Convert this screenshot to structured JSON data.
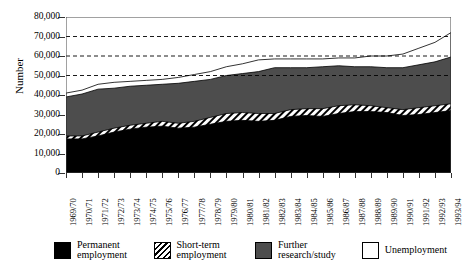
{
  "chart_data": {
    "type": "area",
    "stacked": true,
    "title": "",
    "xlabel": "",
    "ylabel": "Number",
    "ylim": [
      0,
      80000
    ],
    "ytick_step": 10000,
    "ytick_labels": [
      "80,000",
      "70,000",
      "60,000",
      "50,000",
      "40,000",
      "30,000",
      "20,000",
      "10,000",
      "0"
    ],
    "ytick_values": [
      80000,
      70000,
      60000,
      50000,
      40000,
      30000,
      20000,
      10000,
      0
    ],
    "grid": "horizontal-dashed-above-50000",
    "gridlines": [
      50000,
      60000,
      70000
    ],
    "legend_position": "bottom",
    "categories": [
      "1969/70",
      "1970/71",
      "1971/72",
      "1972/73",
      "1973/74",
      "1974/75",
      "1975/76",
      "1976/77",
      "1977/78",
      "1978/79",
      "1979/80",
      "1980/81",
      "1981/82",
      "1982/83",
      "1983/84",
      "1984/85",
      "1985/86",
      "1986/87",
      "1987/88",
      "1988/89",
      "1989/90",
      "1990/91",
      "1991/92",
      "1992/93",
      "1993/94"
    ],
    "series": [
      {
        "name": "Permanent employment",
        "color": "#000000",
        "pattern": "solid",
        "values": [
          17500,
          17500,
          19000,
          21000,
          22500,
          23500,
          24000,
          23000,
          23500,
          25000,
          26500,
          27000,
          26500,
          27000,
          29000,
          29500,
          29000,
          30500,
          31500,
          31500,
          31000,
          29500,
          30000,
          31000,
          32000
        ]
      },
      {
        "name": "Short-term employment",
        "color": "#ffffff",
        "pattern": "diagonal-hatch",
        "values": [
          1500,
          1500,
          2000,
          2000,
          2000,
          2000,
          2500,
          2500,
          3000,
          3500,
          4000,
          4000,
          4000,
          3500,
          3500,
          3500,
          4000,
          4000,
          3500,
          3000,
          2500,
          3000,
          3500,
          3500,
          3500
        ]
      },
      {
        "name": "Further research/study",
        "color": "#4d4d4d",
        "pattern": "solid",
        "values": [
          20000,
          21500,
          22000,
          20500,
          20000,
          19500,
          19000,
          20500,
          20500,
          19500,
          19500,
          20000,
          21500,
          23500,
          21500,
          21000,
          21500,
          20500,
          19500,
          20000,
          20500,
          21500,
          22000,
          22500,
          24000
        ]
      },
      {
        "name": "Unemployment",
        "color": "#ffffff",
        "pattern": "solid",
        "values": [
          2000,
          2000,
          2500,
          3000,
          2500,
          2500,
          2500,
          3000,
          3500,
          4000,
          4500,
          5000,
          6000,
          4500,
          4500,
          4500,
          4000,
          4000,
          4500,
          5500,
          6000,
          7000,
          8500,
          10000,
          12500
        ]
      }
    ]
  },
  "legend": {
    "items": [
      {
        "label_line1": "Permanent",
        "label_line2": "employment",
        "swatch": "black"
      },
      {
        "label_line1": "Short-term",
        "label_line2": "employment",
        "swatch": "hatch"
      },
      {
        "label_line1": "Further",
        "label_line2": "research/study",
        "swatch": "gray"
      },
      {
        "label_line1": "Unemployment",
        "label_line2": "",
        "swatch": "white"
      }
    ]
  }
}
